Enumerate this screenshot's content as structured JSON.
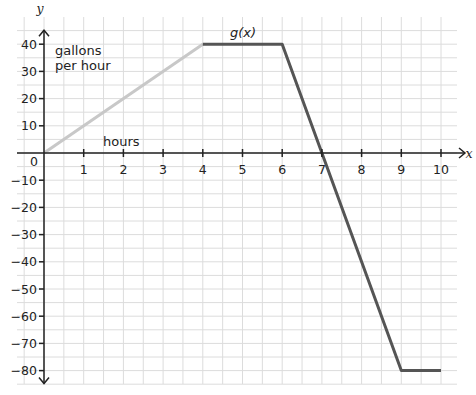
{
  "chart_data": {
    "type": "line",
    "title": "",
    "function_label": "g(x)",
    "xlabel": "x",
    "ylabel": "y",
    "annotations": [
      {
        "text": "gallons",
        "role": "y-units-line-1"
      },
      {
        "text": "per hour",
        "role": "y-units-line-2"
      },
      {
        "text": "hours",
        "role": "x-units"
      }
    ],
    "xlim": [
      0,
      10
    ],
    "ylim": [
      -80,
      40
    ],
    "x_ticks": [
      1,
      2,
      3,
      4,
      5,
      6,
      7,
      8,
      9,
      10
    ],
    "y_ticks": [
      40,
      30,
      20,
      10,
      0,
      -10,
      -20,
      -30,
      -40,
      -50,
      -60,
      -70,
      -80
    ],
    "origin_label": "0",
    "grid": true,
    "grid_minor_x": 0.5,
    "grid_minor_y": 5,
    "series": [
      {
        "name": "g(x) increasing segment",
        "color": "#c8c8c8",
        "points": [
          [
            0,
            0
          ],
          [
            4,
            40
          ]
        ]
      },
      {
        "name": "g(x)",
        "color": "#555555",
        "points": [
          [
            4,
            40
          ],
          [
            6,
            40
          ],
          [
            9,
            -80
          ],
          [
            10,
            -80
          ]
        ]
      }
    ]
  },
  "layout": {
    "origin_px": [
      44,
      153
    ],
    "px_per_x": 39.7,
    "px_per_y": 2.72,
    "grid_bounds_px": {
      "left": 17,
      "top": 17,
      "right": 457,
      "bottom": 384
    }
  },
  "colors": {
    "grid": "#dcdcdc",
    "axis": "#222222",
    "light_line": "#c8c8c8",
    "dark_line": "#555555"
  }
}
